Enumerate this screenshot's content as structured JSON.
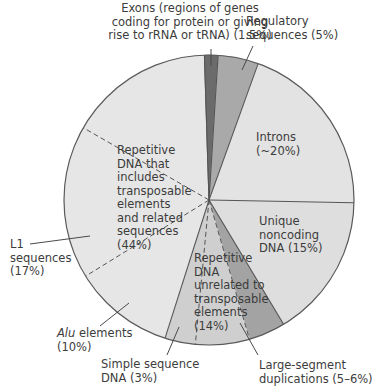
{
  "chart_data": {
    "type": "pie",
    "title": "",
    "center": [
      209,
      200
    ],
    "radius": 145,
    "start_angle_deg": 0,
    "direction": "clockwise",
    "slices": [
      {
        "key": "exons",
        "label": "Exons (regions of genes coding for protein or giving rise to rRNA or tRNA)",
        "value": 1.5,
        "display": "(1.5%)",
        "from": -0.5,
        "to": 1.0,
        "color": "#6b6b6b"
      },
      {
        "key": "regulatory",
        "label": "Regulatory sequences",
        "value": 5,
        "display": "(5%)",
        "from": 1.0,
        "to": 5.5,
        "color": "#a9a9a9"
      },
      {
        "key": "introns",
        "label": "Introns",
        "value": 20,
        "display": "(~20%)",
        "from": 5.5,
        "to": 25.3,
        "color": "#e3e3e3"
      },
      {
        "key": "unique_noncoding",
        "label": "Unique noncoding DNA",
        "value": 15,
        "display": "(15%)",
        "from": 25.3,
        "to": 41.4,
        "color": "#dedede"
      },
      {
        "key": "large_segment_duplications",
        "label": "Large-segment duplications",
        "value": 5.5,
        "display": "(5–6%)",
        "from": 41.4,
        "to": 45.5,
        "color": "#a3a3a3",
        "group": "repetitive_unrelated"
      },
      {
        "key": "repetitive_unrelated_other",
        "label": "Repetitive DNA unrelated to transposable elements (other)",
        "value": 5.5,
        "from": 45.5,
        "to": 51.5,
        "color": "#cfcfcf",
        "group": "repetitive_unrelated"
      },
      {
        "key": "simple_sequence",
        "label": "Simple sequence DNA",
        "value": 3,
        "display": "(3%)",
        "from": 51.5,
        "to": 54.9,
        "color": "#cfcfcf",
        "group": "repetitive_unrelated"
      },
      {
        "key": "alu",
        "label": "Alu elements",
        "value": 10,
        "display": "(10%)",
        "from": 54.9,
        "to": 66.2,
        "color": "#e6e6e6",
        "group": "transposable"
      },
      {
        "key": "l1",
        "label": "L1 sequences",
        "value": 17,
        "display": "(17%)",
        "from": 66.2,
        "to": 83.3,
        "color": "#e6e6e6",
        "group": "transposable"
      },
      {
        "key": "transposable_other",
        "label": "Other transposable elements and related sequences",
        "value": 17,
        "from": 83.3,
        "to": 99.5,
        "color": "#e6e6e6",
        "group": "transposable"
      }
    ],
    "groups": [
      {
        "key": "repetitive_unrelated",
        "label": "Repetitive DNA unrelated to transposable elements",
        "value": 14,
        "display": "(14%)"
      },
      {
        "key": "transposable",
        "label": "Repetitive DNA that includes transposable elements and related sequences",
        "value": 44,
        "display": "(44%)"
      }
    ],
    "solid_boundaries": [
      1.0,
      5.5,
      25.3,
      41.4,
      54.9,
      99.5,
      -0.5
    ],
    "dashed_boundaries": [
      45.5,
      51.5,
      66.2,
      83.3
    ]
  },
  "labels": {
    "exons": [
      "Exons (regions of genes",
      "coding for protein or giving",
      "rise to rRNA or tRNA) (1.5%)"
    ],
    "regulatory": [
      "Regulatory",
      "sequences (5%)"
    ],
    "introns": [
      "Introns",
      "(~20%)"
    ],
    "unique": [
      "Unique",
      "noncoding",
      "DNA (15%)"
    ],
    "transposable": [
      "Repetitive",
      "DNA that",
      "includes",
      "transposable",
      "elements",
      "and related",
      "sequences",
      "(44%)"
    ],
    "l1": [
      "L1",
      "sequences",
      "(17%)"
    ],
    "alu_italic": "Alu",
    "alu_rest": " elements",
    "alu_pct": "(10%)",
    "unrelated": [
      "Repetitive",
      "DNA",
      "unrelated to",
      "transposable",
      "elements",
      "(14%)"
    ],
    "simple": [
      "Simple sequence",
      "DNA (3%)"
    ],
    "large": [
      "Large-segment",
      "duplications (5–6%)"
    ]
  },
  "colors": {
    "outline": "#5a5a5a",
    "leader": "#4a4a4a",
    "text": "#3c3c3c"
  }
}
